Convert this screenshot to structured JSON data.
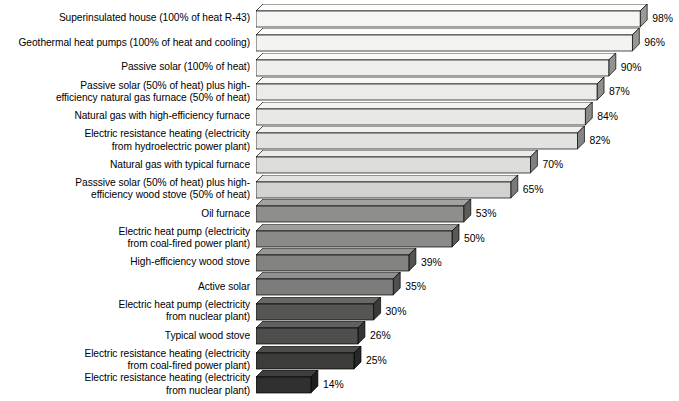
{
  "chart_data": {
    "type": "bar",
    "orientation": "horizontal",
    "title": "",
    "subtitle": "",
    "xlabel": "",
    "ylabel": "",
    "xlim": [
      0,
      100
    ],
    "grid": false,
    "legend": false,
    "value_suffix": "%",
    "categories": [
      "Superinsulated house (100% of heat R-43)",
      "Geothermal heat pumps (100% of heat and cooling)",
      "Passive solar (100% of heat)",
      "Passive solar (50% of heat) plus high-\nefficiency natural gas furnace (50% of heat)",
      "Natural gas with high-efficiency furnace",
      "Electric resistance heating (electricity\nfrom hydroelectric power plant)",
      "Natural gas with typical furnace",
      "Passsive solar (50% of heat) plus high-\nefficiency wood stove (50% of heat)",
      "Oil furnace",
      "Electric heat pump (electricity\nfrom coal-fired power plant)",
      "High-efficiency wood stove",
      "Active solar",
      "Electric heat pump (electricity\nfrom nuclear plant)",
      "Typical wood stove",
      "Electric resistance heating (electricity\nfrom coal-fired power plant)",
      "Electric resistance heating (electricity\nfrom nuclear plant)"
    ],
    "values": [
      98,
      96,
      90,
      87,
      84,
      82,
      70,
      65,
      53,
      50,
      39,
      35,
      30,
      26,
      25,
      14
    ],
    "value_labels": [
      "98%",
      "96%",
      "90%",
      "87%",
      "84%",
      "82%",
      "70%",
      "65%",
      "53%",
      "50%",
      "39%",
      "35%",
      "30%",
      "26%",
      "25%",
      "14%"
    ],
    "bar_face_colors": [
      "#f5f5f3",
      "#f3f3f1",
      "#efefed",
      "#ebebe9",
      "#e8e8e6",
      "#e2e2e0",
      "#dcdcda",
      "#d2d2d0",
      "#8e8e8c",
      "#8a8a88",
      "#828280",
      "#7c7c7a",
      "#565654",
      "#4e4e4c",
      "#3c3c3a",
      "#303030"
    ],
    "bar_side_colors": [
      "#9a9a98",
      "#979795",
      "#929290",
      "#8e8e8c",
      "#8a8a88",
      "#858583",
      "#808080",
      "#79797a",
      "#5c5c5a",
      "#595957",
      "#545452",
      "#505050",
      "#3a3a38",
      "#343432",
      "#282826",
      "#1e1e1e"
    ],
    "bar_top_colors": [
      "#fdfdfb",
      "#fcfcfa",
      "#fafaf8",
      "#f7f7f5",
      "#f4f4f2",
      "#f0f0ee",
      "#ebebe9",
      "#e2e2e0",
      "#a2a2a0",
      "#9e9e9c",
      "#969694",
      "#909090",
      "#686866",
      "#606060",
      "#4c4c4a",
      "#3e3e3e"
    ],
    "outline_color": "#000000",
    "background_color": "#ffffff",
    "text_color": "#000000"
  },
  "axis": {
    "label_right_edge_px": 250,
    "bar_origin_px": 256,
    "bar_scale_px_per_percent": 3.92
  }
}
